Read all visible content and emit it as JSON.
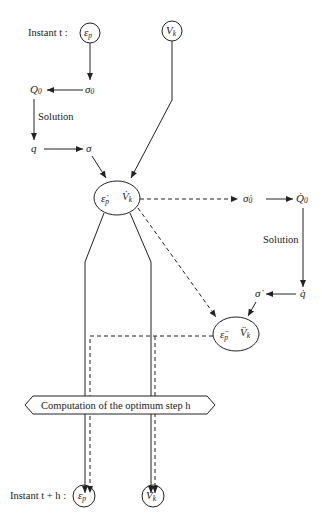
{
  "diagram": {
    "labels": {
      "instant_t": "Instant t :",
      "instant_t_h": "Instant t + h :",
      "solution_left": "Solution",
      "solution_right": "Solution",
      "optimum_step": "Computation of the optimum step h"
    },
    "nodes": {
      "eps_top": {
        "main": "ε",
        "sub": "p"
      },
      "vk_top": {
        "main": "V",
        "sub": "k"
      },
      "sigma0": {
        "main": "σ",
        "sub": "0"
      },
      "Q0": {
        "main": "Q",
        "sub": "0"
      },
      "q": {
        "main": "q"
      },
      "sigma": {
        "main": "σ"
      },
      "rate_eps": {
        "main": "ε̇",
        "sub": "p"
      },
      "rate_vk": {
        "main": "V̇",
        "sub": "k"
      },
      "sigma0_dot": {
        "main": "σ̇",
        "sub": "0"
      },
      "Q0_dot": {
        "main": "Q̇",
        "sub": "0"
      },
      "q_dot": {
        "main": "q̇"
      },
      "sigma_dot": {
        "main": "σ̇"
      },
      "acc_eps": {
        "main": "ε̈",
        "sub": "p"
      },
      "acc_vk": {
        "main": "V̈",
        "sub": "k"
      },
      "eps_bottom": {
        "main": "ε",
        "sub": "p"
      },
      "vk_bottom": {
        "main": "V",
        "sub": "k"
      }
    }
  }
}
